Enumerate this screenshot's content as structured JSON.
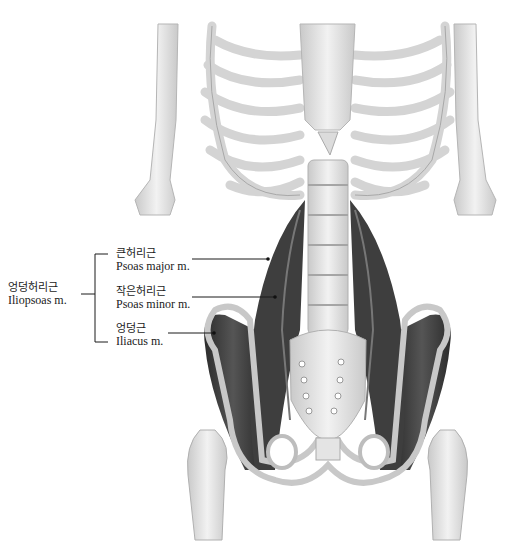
{
  "figure": {
    "colors": {
      "bone": "#e9e9e9",
      "bone_shade": "#bdbdbd",
      "muscle": "#3a3a3a",
      "muscle_light": "#5c5c5c",
      "line": "#1a1a1a",
      "background": "#ffffff"
    }
  },
  "labels": {
    "group": {
      "korean": "엉덩허리근",
      "english": "Iliopsoas m."
    },
    "items": [
      {
        "korean": "큰허리근",
        "english": "Psoas major m."
      },
      {
        "korean": "작은허리근",
        "english": "Psoas minor m."
      },
      {
        "korean": "엉덩근",
        "english": "Iliacus m."
      }
    ]
  }
}
